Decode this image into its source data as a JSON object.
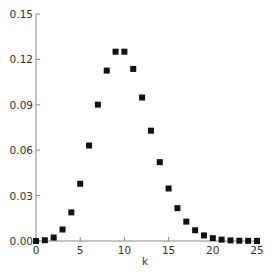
{
  "chart_data": {
    "type": "scatter",
    "title": "",
    "xlabel": "k",
    "ylabel": "",
    "xlim": [
      0,
      25
    ],
    "ylim": [
      0,
      0.15
    ],
    "grid": false,
    "legend": null,
    "x_ticks": [
      "0",
      "5",
      "10",
      "15",
      "20",
      "25"
    ],
    "y_ticks": [
      "0.00",
      "0.03",
      "0.06",
      "0.09",
      "0.12",
      "0.15"
    ],
    "marker": "square",
    "marker_color": "#111111",
    "x": [
      0,
      1,
      2,
      3,
      4,
      5,
      6,
      7,
      8,
      9,
      10,
      11,
      12,
      13,
      14,
      15,
      16,
      17,
      18,
      19,
      20,
      21,
      22,
      23,
      24,
      25
    ],
    "values": [
      0.0,
      0.0005,
      0.0023,
      0.0076,
      0.0189,
      0.0378,
      0.0631,
      0.0901,
      0.1126,
      0.1251,
      0.1251,
      0.1137,
      0.0948,
      0.0729,
      0.0521,
      0.0347,
      0.0217,
      0.0128,
      0.0071,
      0.0037,
      0.0019,
      0.0009,
      0.0004,
      0.0002,
      0.0001,
      0.0
    ]
  },
  "axis_color": "#888888"
}
